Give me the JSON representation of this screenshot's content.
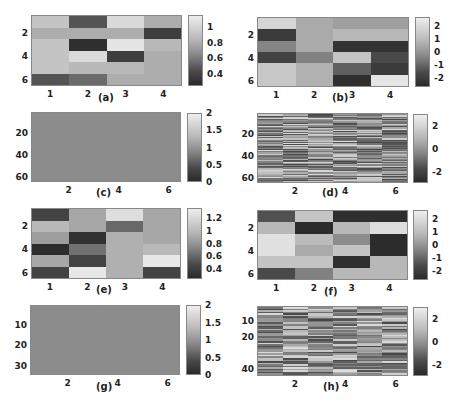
{
  "chart_data": [
    {
      "id": "a",
      "type": "heatmap",
      "caption": "(a)",
      "rows": 6,
      "cols": 4,
      "xticks": [
        "1",
        "2",
        "3",
        "4"
      ],
      "yticks": [
        "2",
        "4",
        "6"
      ],
      "colorbar": {
        "range": [
          0.25,
          1.15
        ],
        "ticks": [
          "1",
          "0.8",
          "0.6",
          "0.4"
        ]
      },
      "values": [
        [
          0.95,
          0.45,
          1.05,
          0.85
        ],
        [
          0.85,
          0.85,
          0.85,
          0.35
        ],
        [
          0.95,
          0.28,
          1.1,
          0.9
        ],
        [
          0.95,
          1.05,
          0.35,
          0.85
        ],
        [
          0.95,
          0.9,
          0.9,
          0.85
        ],
        [
          0.45,
          0.55,
          0.85,
          0.85
        ]
      ]
    },
    {
      "id": "b",
      "type": "heatmap",
      "caption": "(b)",
      "rows": 6,
      "cols": 4,
      "xticks": [
        "1",
        "2",
        "3",
        "4"
      ],
      "yticks": [
        "2",
        "4",
        "6"
      ],
      "colorbar": {
        "range": [
          -2.7,
          2.7
        ],
        "ticks": [
          "2",
          "1",
          "0",
          "-1",
          "-2"
        ]
      },
      "values": [
        [
          2.0,
          0.8,
          0.5,
          0.5
        ],
        [
          -2.2,
          0.8,
          1.2,
          1.2
        ],
        [
          -0.2,
          0.8,
          -2.4,
          -2.4
        ],
        [
          -2.0,
          -0.3,
          1.5,
          -1.8
        ],
        [
          1.6,
          1.0,
          -1.2,
          -2.2
        ],
        [
          1.6,
          1.0,
          -2.5,
          2.4
        ]
      ]
    },
    {
      "id": "c",
      "type": "heatmap",
      "caption": "(c)",
      "rows": 64,
      "cols": 6,
      "xticks": [
        "2",
        "4",
        "6"
      ],
      "yticks": [
        "20",
        "40",
        "60"
      ],
      "colorbar": {
        "range": [
          0,
          2
        ],
        "ticks": [
          "2",
          "1.5",
          "1",
          "0.5",
          "0"
        ]
      },
      "uniform_value": 1.0
    },
    {
      "id": "d",
      "type": "heatmap",
      "caption": "(d)",
      "rows": 64,
      "cols": 6,
      "xticks": [
        "2",
        "4",
        "6"
      ],
      "yticks": [
        "20",
        "40",
        "60"
      ],
      "colorbar": {
        "range": [
          -3,
          3
        ],
        "ticks": [
          "2",
          "0",
          "-2"
        ]
      },
      "pattern": "horizontal random bands per column"
    },
    {
      "id": "e",
      "type": "heatmap",
      "caption": "(e)",
      "rows": 6,
      "cols": 4,
      "xticks": [
        "1",
        "2",
        "3",
        "4"
      ],
      "yticks": [
        "2",
        "4",
        "6"
      ],
      "colorbar": {
        "range": [
          0.25,
          1.35
        ],
        "ticks": [
          "1.2",
          "1",
          "0.8",
          "0.6",
          "0.4"
        ]
      },
      "values": [
        [
          0.4,
          0.95,
          1.25,
          0.95
        ],
        [
          1.05,
          0.95,
          0.6,
          0.95
        ],
        [
          0.9,
          0.3,
          1.0,
          0.95
        ],
        [
          0.28,
          0.65,
          1.0,
          1.05
        ],
        [
          0.95,
          0.4,
          1.0,
          1.3
        ],
        [
          0.4,
          1.3,
          1.0,
          0.4
        ]
      ]
    },
    {
      "id": "f",
      "type": "heatmap",
      "caption": "(f)",
      "rows": 6,
      "cols": 4,
      "xticks": [
        "1",
        "2",
        "3",
        "4"
      ],
      "yticks": [
        "2",
        "4",
        "6"
      ],
      "colorbar": {
        "range": [
          -2.7,
          2.7
        ],
        "ticks": [
          "2",
          "1",
          "0",
          "-1",
          "-2"
        ]
      },
      "values": [
        [
          -1.6,
          1.5,
          -2.5,
          -2.5
        ],
        [
          1.2,
          -2.6,
          1.2,
          2.2
        ],
        [
          2.3,
          1.3,
          0.0,
          -2.6
        ],
        [
          2.3,
          0.8,
          1.5,
          -2.6
        ],
        [
          1.5,
          1.5,
          -2.5,
          1.2
        ],
        [
          -1.8,
          -0.3,
          1.2,
          1.2
        ]
      ]
    },
    {
      "id": "g",
      "type": "heatmap",
      "caption": "(g)",
      "rows": 34,
      "cols": 6,
      "xticks": [
        "2",
        "4",
        "6"
      ],
      "yticks": [
        "10",
        "20",
        "30"
      ],
      "colorbar": {
        "range": [
          0,
          2
        ],
        "ticks": [
          "2",
          "1.5",
          "1",
          "0.5",
          "0"
        ]
      },
      "uniform_value": 1.0
    },
    {
      "id": "h",
      "type": "heatmap",
      "caption": "(h)",
      "rows": 44,
      "cols": 6,
      "xticks": [
        "2",
        "4",
        "6"
      ],
      "yticks": [
        "10",
        "20",
        "40"
      ],
      "colorbar": {
        "range": [
          -3,
          3
        ],
        "ticks": [
          "2",
          "0",
          "-2"
        ]
      },
      "pattern": "horizontal random bands per column"
    }
  ],
  "captions": {
    "a": "(a)",
    "b": "(b)",
    "c": "(c)",
    "d": "(d)",
    "e": "(e)",
    "f": "(f)",
    "g": "(g)",
    "h": "(h)"
  }
}
